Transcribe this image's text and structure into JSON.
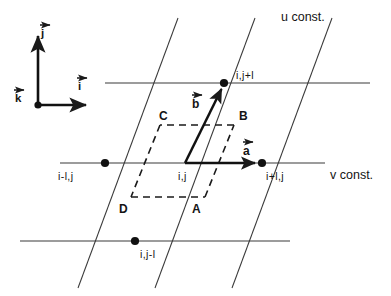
{
  "figure": {
    "background_color": "#ffffff",
    "line_color": "#262626",
    "text_color": "#141414"
  },
  "axis_labels": {
    "u_const": "u const.",
    "v_const": "v const."
  },
  "nodes": [
    {
      "id": "node-center",
      "label": "i,j",
      "x": 185,
      "y": 163,
      "dot": false
    },
    {
      "id": "node-right",
      "label": "i+l,j",
      "x": 262,
      "y": 163,
      "dot": true
    },
    {
      "id": "node-left",
      "label": "i-l,j",
      "x": 105,
      "y": 163,
      "dot": true
    },
    {
      "id": "node-top",
      "label": "i,j+l",
      "x": 224,
      "y": 83,
      "dot": true
    },
    {
      "id": "node-bottom",
      "label": "i,j-l",
      "x": 135,
      "y": 241,
      "dot": true
    }
  ],
  "vectors": [
    {
      "id": "vector-a",
      "label": "a",
      "from": [
        185,
        163
      ],
      "to": [
        262,
        163
      ]
    },
    {
      "id": "vector-b",
      "label": "b",
      "from": [
        185,
        163
      ],
      "to": [
        224,
        84
      ]
    }
  ],
  "cell_corners": [
    {
      "id": "corner-a",
      "label": "A",
      "x": 196,
      "y": 206
    },
    {
      "id": "corner-b",
      "label": "B",
      "x": 243,
      "y": 116
    },
    {
      "id": "corner-c",
      "label": "C",
      "x": 163,
      "y": 116
    },
    {
      "id": "corner-d",
      "label": "D",
      "x": 122,
      "y": 206
    }
  ],
  "triad": {
    "origin_label": "k",
    "vertical_label": "j",
    "horizontal_label": "i",
    "origin": [
      38,
      105
    ],
    "vertical_tip": [
      38,
      30
    ],
    "horizontal_tip": [
      92,
      105
    ]
  },
  "grid": {
    "v_const_lines": [
      {
        "id": "v-line-top",
        "y": 83,
        "x1": 105,
        "x2": 370
      },
      {
        "id": "v-line-middle",
        "y": 163,
        "x1": 60,
        "x2": 325
      },
      {
        "id": "v-line-bottom",
        "y": 241,
        "x1": 20,
        "x2": 290
      }
    ],
    "u_const_lines": [
      {
        "id": "u-line-left",
        "x_top": 178,
        "x_bottom": 78
      },
      {
        "id": "u-line-middle",
        "x_top": 255,
        "x_bottom": 155
      },
      {
        "id": "u-line-right",
        "x_top": 332,
        "x_bottom": 232
      }
    ]
  }
}
